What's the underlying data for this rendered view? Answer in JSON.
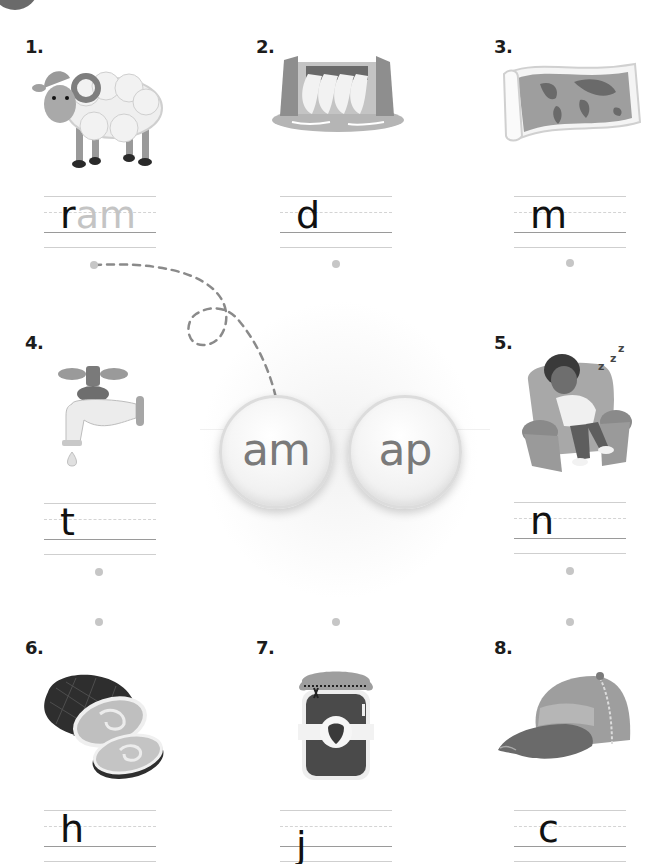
{
  "worksheet": {
    "instruction_task": "Match each picture's word ending (am / ap) and complete the word",
    "endings": [
      {
        "label": "am",
        "color": "#7a7a7a"
      },
      {
        "label": "ap",
        "color": "#7a7a7a"
      }
    ],
    "items": [
      {
        "number": "1.",
        "picture": "ram",
        "start": "r",
        "ghost": "am"
      },
      {
        "number": "2.",
        "picture": "dam",
        "start": "d",
        "ghost": ""
      },
      {
        "number": "3.",
        "picture": "map",
        "start": "m",
        "ghost": ""
      },
      {
        "number": "4.",
        "picture": "tap",
        "start": "t",
        "ghost": ""
      },
      {
        "number": "5.",
        "picture": "nap",
        "start": "n",
        "ghost": ""
      },
      {
        "number": "6.",
        "picture": "ham",
        "start": "h",
        "ghost": ""
      },
      {
        "number": "7.",
        "picture": "jam",
        "start": "j",
        "ghost": ""
      },
      {
        "number": "8.",
        "picture": "cap",
        "start": "c",
        "ghost": ""
      }
    ]
  }
}
